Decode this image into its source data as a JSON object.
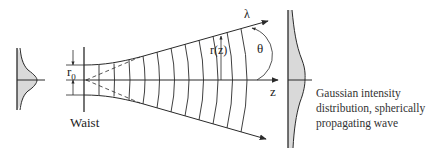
{
  "diagram": {
    "labels": {
      "r0": "r",
      "r0_sub": "0",
      "rz": "r(z)",
      "lambda": "λ",
      "theta": "θ",
      "z": "z",
      "waist": "Waist"
    },
    "caption": {
      "lines": [
        "Gaussian intensity",
        "distribution, spherically",
        "propagating wave"
      ]
    },
    "colors": {
      "line": "#2a2a2a",
      "fill": "#d9d9d9",
      "background": "#ffffff"
    }
  }
}
